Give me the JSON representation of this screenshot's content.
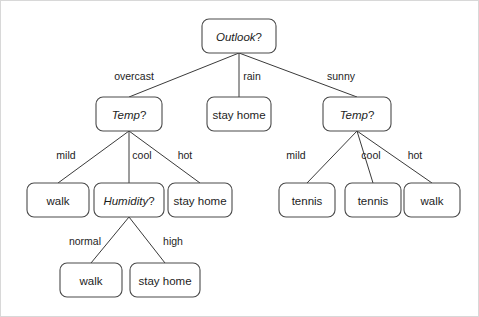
{
  "diagram": {
    "type": "decision-tree",
    "style": {
      "background": "#ffffff",
      "frame_border": "#d8d8d8",
      "node_border": "#4a4a4a",
      "node_fill": "#ffffff",
      "edge_stroke": "#3a3a3a",
      "text_color": "#1d1d1d"
    },
    "nodes": [
      {
        "id": "outlook",
        "label": "Outlook",
        "suffix": "?",
        "kind": "internal",
        "x": 238,
        "y": 35,
        "w": 74,
        "h": 34
      },
      {
        "id": "temp_left",
        "label": "Temp",
        "suffix": "?",
        "kind": "internal",
        "x": 128,
        "y": 113,
        "w": 66,
        "h": 34
      },
      {
        "id": "stay_rain",
        "label": "stay home",
        "suffix": "",
        "kind": "leaf",
        "x": 238,
        "y": 113,
        "w": 64,
        "h": 34
      },
      {
        "id": "temp_right",
        "label": "Temp",
        "suffix": "?",
        "kind": "internal",
        "x": 356,
        "y": 113,
        "w": 68,
        "h": 34
      },
      {
        "id": "walk_mild",
        "label": "walk",
        "suffix": "",
        "kind": "leaf",
        "x": 57,
        "y": 199,
        "w": 62,
        "h": 34
      },
      {
        "id": "humidity",
        "label": "Humidity",
        "suffix": "?",
        "kind": "internal",
        "x": 128,
        "y": 199,
        "w": 70,
        "h": 34
      },
      {
        "id": "stay_hot",
        "label": "stay home",
        "suffix": "",
        "kind": "leaf",
        "x": 199,
        "y": 199,
        "w": 64,
        "h": 34
      },
      {
        "id": "tennis_mild",
        "label": "tennis",
        "suffix": "",
        "kind": "leaf",
        "x": 306,
        "y": 199,
        "w": 56,
        "h": 34
      },
      {
        "id": "tennis_cool",
        "label": "tennis",
        "suffix": "",
        "kind": "leaf",
        "x": 372,
        "y": 199,
        "w": 56,
        "h": 34
      },
      {
        "id": "walk_hot",
        "label": "walk",
        "suffix": "",
        "kind": "leaf",
        "x": 431,
        "y": 199,
        "w": 56,
        "h": 34
      },
      {
        "id": "walk_normal",
        "label": "walk",
        "suffix": "",
        "kind": "leaf",
        "x": 90,
        "y": 279,
        "w": 62,
        "h": 34
      },
      {
        "id": "stay_high",
        "label": "stay home",
        "suffix": "",
        "kind": "leaf",
        "x": 164,
        "y": 279,
        "w": 70,
        "h": 34
      }
    ],
    "edges": [
      {
        "id": "e-overcast",
        "from": "outlook",
        "to": "temp_left",
        "label": "overcast",
        "lx": 133,
        "ly": 75
      },
      {
        "id": "e-rain",
        "from": "outlook",
        "to": "stay_rain",
        "label": "rain",
        "lx": 251,
        "ly": 75
      },
      {
        "id": "e-sunny",
        "from": "outlook",
        "to": "temp_right",
        "label": "sunny",
        "lx": 340,
        "ly": 75
      },
      {
        "id": "e-l-mild",
        "from": "temp_left",
        "to": "walk_mild",
        "label": "mild",
        "lx": 65,
        "ly": 154
      },
      {
        "id": "e-l-cool",
        "from": "temp_left",
        "to": "humidity",
        "label": "cool",
        "lx": 141,
        "ly": 154
      },
      {
        "id": "e-l-hot",
        "from": "temp_left",
        "to": "stay_hot",
        "label": "hot",
        "lx": 184,
        "ly": 154
      },
      {
        "id": "e-r-mild",
        "from": "temp_right",
        "to": "tennis_mild",
        "label": "mild",
        "lx": 295,
        "ly": 154
      },
      {
        "id": "e-r-cool",
        "from": "temp_right",
        "to": "tennis_cool",
        "label": "cool",
        "lx": 370,
        "ly": 154
      },
      {
        "id": "e-r-hot",
        "from": "temp_right",
        "to": "walk_hot",
        "label": "hot",
        "lx": 414,
        "ly": 154
      },
      {
        "id": "e-normal",
        "from": "humidity",
        "to": "walk_normal",
        "label": "normal",
        "lx": 84,
        "ly": 240
      },
      {
        "id": "e-high",
        "from": "humidity",
        "to": "stay_high",
        "label": "high",
        "lx": 172,
        "ly": 240
      }
    ]
  }
}
